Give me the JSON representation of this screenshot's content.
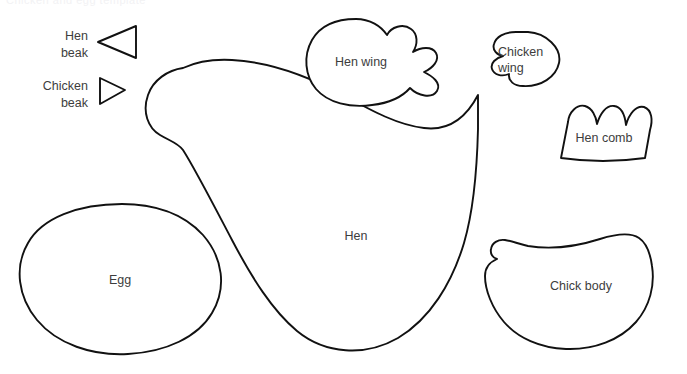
{
  "page": {
    "background_color": "#ffffff",
    "width": 687,
    "height": 374,
    "clipped_header_text": "Chicken and egg template"
  },
  "style": {
    "outline_color": "#111111",
    "label_color": "#3d3d3d",
    "fill_color": "#ffffff"
  },
  "callouts": [
    {
      "id": "hen-beak",
      "label_line1": "Hen",
      "label_line2": "beak",
      "shape": "triangle-pointing-left"
    },
    {
      "id": "chicken-beak",
      "label_line1": "Chicken",
      "label_line2": "beak",
      "shape": "triangle-pointing-right"
    }
  ],
  "pieces": [
    {
      "id": "hen",
      "label": "Hen",
      "shape": "hen-body-silhouette"
    },
    {
      "id": "hen-wing",
      "label": "Hen wing",
      "shape": "wing-with-three-right-scallops"
    },
    {
      "id": "chicken-wing",
      "label_line1": "Chicken",
      "label_line2": "wing",
      "shape": "small-wing-with-left-scallops"
    },
    {
      "id": "hen-comb",
      "label": "Hen comb",
      "shape": "crown-with-three-bumps"
    },
    {
      "id": "egg",
      "label": "Egg",
      "shape": "oval-egg"
    },
    {
      "id": "chick-body",
      "label": "Chick body",
      "shape": "chick-body-silhouette"
    }
  ]
}
